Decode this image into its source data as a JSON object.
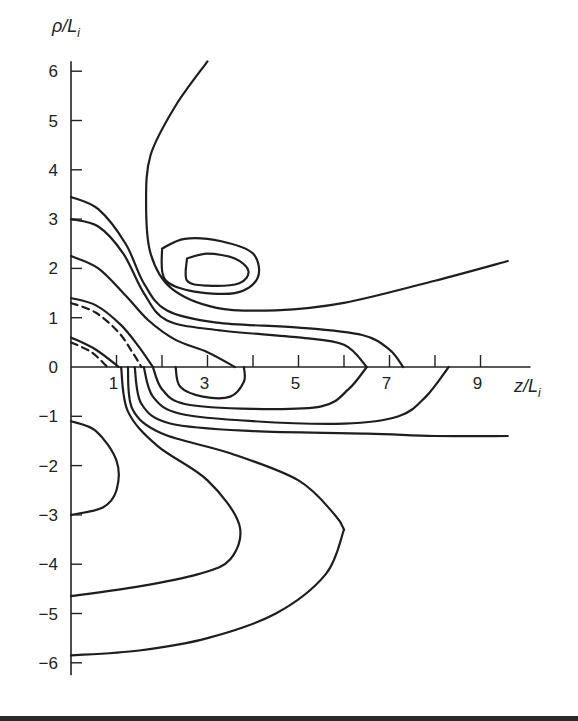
{
  "chart_data": {
    "type": "contour",
    "title": "",
    "xlabel": "z/L",
    "xlabel_sub": "i",
    "ylabel": "ρ/L",
    "ylabel_sub": "i",
    "xlim": [
      0,
      10
    ],
    "ylim": [
      -6.2,
      6.2
    ],
    "x_ticks": [
      0.5,
      1,
      1.5,
      2,
      2.5,
      3,
      3.5,
      4,
      4.5,
      5,
      5.5,
      6,
      6.5,
      7,
      7.5,
      8,
      8.5,
      9
    ],
    "x_tick_labels": [
      {
        "value": 1,
        "label": "1"
      },
      {
        "value": 3,
        "label": "3"
      },
      {
        "value": 5,
        "label": "5"
      },
      {
        "value": 7,
        "label": "7"
      },
      {
        "value": 9,
        "label": "9"
      }
    ],
    "y_ticks": [
      {
        "value": 6,
        "label": "6"
      },
      {
        "value": 5,
        "label": "5"
      },
      {
        "value": 4,
        "label": "4"
      },
      {
        "value": 3,
        "label": "3"
      },
      {
        "value": 2,
        "label": "2"
      },
      {
        "value": 1,
        "label": "1"
      },
      {
        "value": 0,
        "label": "0"
      },
      {
        "value": -1,
        "label": "−1"
      },
      {
        "value": -2,
        "label": "−2"
      },
      {
        "value": -3,
        "label": "−3"
      },
      {
        "value": -4,
        "label": "−4"
      },
      {
        "value": -5,
        "label": "−5"
      },
      {
        "value": -6,
        "label": "−6"
      }
    ],
    "grid": false,
    "contours": [
      {
        "name": "outer-upper-open",
        "style": "solid",
        "points": [
          [
            3.0,
            6.2
          ],
          [
            2.3,
            5.3
          ],
          [
            1.75,
            4.3
          ],
          [
            1.65,
            3.3
          ],
          [
            1.75,
            2.3
          ],
          [
            2.2,
            1.6
          ],
          [
            3.2,
            1.2
          ],
          [
            4.5,
            1.15
          ],
          [
            6.0,
            1.3
          ],
          [
            8.0,
            1.75
          ],
          [
            9.6,
            2.15
          ]
        ]
      },
      {
        "name": "island-outer",
        "style": "solid",
        "points": [
          [
            2.0,
            2.4
          ],
          [
            2.5,
            2.6
          ],
          [
            3.3,
            2.55
          ],
          [
            4.0,
            2.3
          ],
          [
            4.1,
            1.8
          ],
          [
            3.6,
            1.5
          ],
          [
            2.6,
            1.55
          ],
          [
            2.05,
            1.8
          ],
          [
            2.0,
            2.4
          ]
        ]
      },
      {
        "name": "island-inner",
        "style": "solid",
        "points": [
          [
            2.55,
            2.2
          ],
          [
            3.0,
            2.3
          ],
          [
            3.6,
            2.2
          ],
          [
            3.9,
            1.95
          ],
          [
            3.7,
            1.7
          ],
          [
            3.0,
            1.65
          ],
          [
            2.55,
            1.75
          ],
          [
            2.55,
            2.2
          ]
        ]
      },
      {
        "name": "upper-3.5",
        "style": "solid",
        "points": [
          [
            0,
            3.45
          ],
          [
            0.6,
            3.2
          ],
          [
            1.2,
            2.5
          ],
          [
            1.6,
            1.7
          ],
          [
            2.1,
            1.15
          ],
          [
            3.2,
            0.9
          ],
          [
            5.0,
            0.8
          ],
          [
            6.4,
            0.65
          ],
          [
            7.0,
            0.35
          ],
          [
            7.3,
            0
          ]
        ]
      },
      {
        "name": "upper-3.0",
        "style": "solid",
        "points": [
          [
            0,
            3.0
          ],
          [
            0.6,
            2.85
          ],
          [
            1.15,
            2.3
          ],
          [
            1.6,
            1.5
          ],
          [
            2.1,
            0.95
          ],
          [
            3.2,
            0.75
          ],
          [
            5.0,
            0.6
          ],
          [
            6.0,
            0.45
          ],
          [
            6.5,
            0
          ]
        ]
      },
      {
        "name": "upper-2.2",
        "style": "solid",
        "points": [
          [
            0,
            2.25
          ],
          [
            0.6,
            2.0
          ],
          [
            1.2,
            1.45
          ],
          [
            1.7,
            0.95
          ],
          [
            2.3,
            0.55
          ],
          [
            3.0,
            0.3
          ],
          [
            3.6,
            0
          ]
        ]
      },
      {
        "name": "upper-1.4",
        "style": "solid",
        "points": [
          [
            0,
            1.4
          ],
          [
            0.55,
            1.25
          ],
          [
            1.1,
            0.85
          ],
          [
            1.5,
            0.4
          ],
          [
            1.8,
            0
          ]
        ]
      },
      {
        "name": "upper-1.3-dashed",
        "style": "dashed",
        "points": [
          [
            0,
            1.3
          ],
          [
            0.55,
            1.1
          ],
          [
            1.05,
            0.7
          ],
          [
            1.35,
            0.3
          ],
          [
            1.55,
            0
          ]
        ]
      },
      {
        "name": "upper-0.6",
        "style": "solid",
        "points": [
          [
            0,
            0.6
          ],
          [
            0.55,
            0.35
          ],
          [
            1.05,
            0
          ]
        ]
      },
      {
        "name": "upper-0.5-dashed",
        "style": "dashed",
        "points": [
          [
            0,
            0.5
          ],
          [
            0.45,
            0.3
          ],
          [
            0.8,
            0
          ]
        ]
      },
      {
        "name": "lower-bubble",
        "style": "solid",
        "points": [
          [
            2.3,
            0
          ],
          [
            2.4,
            -0.4
          ],
          [
            2.9,
            -0.6
          ],
          [
            3.5,
            -0.6
          ],
          [
            3.8,
            -0.3
          ],
          [
            3.8,
            0
          ]
        ]
      },
      {
        "name": "lower-6.5",
        "style": "solid",
        "points": [
          [
            1.8,
            0
          ],
          [
            2.0,
            -0.45
          ],
          [
            2.5,
            -0.75
          ],
          [
            4.0,
            -0.85
          ],
          [
            5.5,
            -0.8
          ],
          [
            6.1,
            -0.45
          ],
          [
            6.5,
            0
          ]
        ]
      },
      {
        "name": "lower-8.5",
        "style": "solid",
        "points": [
          [
            1.6,
            0
          ],
          [
            1.8,
            -0.6
          ],
          [
            2.4,
            -0.95
          ],
          [
            4.0,
            -1.1
          ],
          [
            6.0,
            -1.15
          ],
          [
            7.2,
            -1.0
          ],
          [
            7.8,
            -0.6
          ],
          [
            8.3,
            0
          ]
        ]
      },
      {
        "name": "lower-open-right",
        "style": "solid",
        "points": [
          [
            1.4,
            0
          ],
          [
            1.55,
            -0.75
          ],
          [
            2.2,
            -1.15
          ],
          [
            4.0,
            -1.3
          ],
          [
            6.5,
            -1.35
          ],
          [
            8.0,
            -1.4
          ],
          [
            9.6,
            -1.4
          ]
        ]
      },
      {
        "name": "lower-far-1",
        "style": "solid",
        "points": [
          [
            1.25,
            0
          ],
          [
            1.35,
            -0.85
          ],
          [
            2.0,
            -1.35
          ],
          [
            3.5,
            -1.75
          ],
          [
            5.0,
            -2.3
          ],
          [
            5.8,
            -3.0
          ],
          [
            6.0,
            -3.3
          ]
        ]
      },
      {
        "name": "lower-far-2",
        "style": "solid",
        "points": [
          [
            1.1,
            0
          ],
          [
            1.25,
            -0.9
          ],
          [
            1.9,
            -1.6
          ],
          [
            3.0,
            -2.3
          ],
          [
            3.7,
            -3.2
          ],
          [
            3.5,
            -3.9
          ],
          [
            2.8,
            -4.2
          ],
          [
            1.5,
            -4.45
          ],
          [
            0,
            -4.65
          ]
        ]
      },
      {
        "name": "lower-far-3",
        "style": "solid",
        "points": [
          [
            6.0,
            -3.3
          ],
          [
            5.6,
            -4.2
          ],
          [
            4.5,
            -5.0
          ],
          [
            3.0,
            -5.5
          ],
          [
            1.5,
            -5.75
          ],
          [
            0,
            -5.85
          ]
        ]
      },
      {
        "name": "left-lobe",
        "style": "solid",
        "points": [
          [
            0,
            -1.1
          ],
          [
            0.55,
            -1.3
          ],
          [
            1.0,
            -1.9
          ],
          [
            1.0,
            -2.5
          ],
          [
            0.7,
            -2.85
          ],
          [
            0,
            -3.0
          ]
        ]
      }
    ]
  }
}
